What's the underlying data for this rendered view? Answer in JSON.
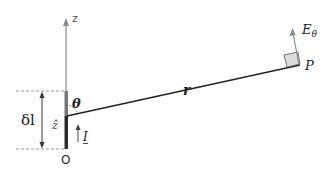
{
  "diagram": {
    "labels": {
      "z_axis": "z",
      "origin": "O",
      "length": "δl",
      "unit_z": "ẑ",
      "current": "I",
      "angle": "θ",
      "radius": "r",
      "field": "E",
      "field_sub": "θ",
      "point": "P"
    },
    "colors": {
      "axis": "#8a8a8a",
      "element": "#3a3a3a",
      "line": "#222222",
      "dashed": "#888888",
      "square_fill": "#dcdcdc",
      "text": "#222222"
    }
  }
}
